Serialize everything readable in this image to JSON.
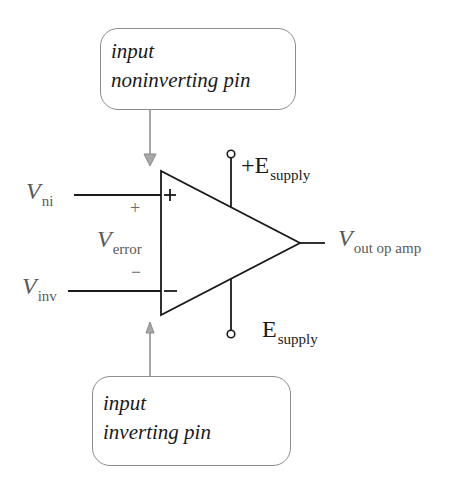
{
  "callouts": {
    "noninverting": {
      "line1": "input",
      "line2": "noninverting pin"
    },
    "inverting": {
      "line1": "input",
      "line2": "inverting pin"
    }
  },
  "labels": {
    "v_ni": {
      "main": "V",
      "sub": "ni"
    },
    "v_inv": {
      "main": "V",
      "sub": "inv"
    },
    "v_error": {
      "main": "V",
      "sub": "error"
    },
    "v_out": {
      "main": "V",
      "sub": "out op amp"
    },
    "pos_supply": {
      "main": "+E",
      "sub": "supply"
    },
    "neg_supply": {
      "main": "E",
      "sub": "supply"
    }
  },
  "signs": {
    "pin_plus": "+",
    "pin_minus": "−",
    "error_plus": "+",
    "error_minus": "−"
  },
  "colors": {
    "wire": "#1a1a1a",
    "arrow": "#8a8a8a",
    "label": "#5a5a5a",
    "box_border": "#8c8c8c"
  }
}
